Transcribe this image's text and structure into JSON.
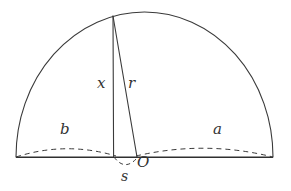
{
  "figure": {
    "kind": "geometry-diagram",
    "background_color": "#ffffff",
    "stroke_color": "#3a3a3a",
    "label_color": "#333333",
    "canvas": {
      "width": 291,
      "height": 191
    }
  },
  "labels": {
    "x": "x",
    "r": "r",
    "a": "a",
    "b": "b",
    "O": "O",
    "s": "s"
  },
  "geometry": {
    "baseline": {
      "x1": 16,
      "y1": 157,
      "x2": 273,
      "y2": 157
    },
    "semicircle": {
      "cx": 144.5,
      "cy": 157,
      "rx": 128.5,
      "ry": 145
    },
    "vertical_segment": {
      "x1": 113,
      "y1": 16,
      "x2": 113,
      "y2": 157
    },
    "radius_segment": {
      "x1": 113,
      "y1": 16,
      "x2": 137,
      "y2": 157
    },
    "dashed_arc_b": {
      "from_x": 16,
      "from_y": 157,
      "to_x": 116,
      "to_y": 157,
      "bulge": 12
    },
    "dashed_arc_a": {
      "from_x": 136,
      "from_y": 157,
      "to_x": 273,
      "to_y": 157,
      "bulge": 13
    },
    "dashed_arc_s": {
      "from_x": 114,
      "from_y": 157,
      "to_x": 137,
      "to_y": 157,
      "dip": 11
    },
    "point_O": {
      "x": 137,
      "y": 157
    },
    "point_foot_x": {
      "x": 113,
      "y": 157
    },
    "point_apex": {
      "x": 113,
      "y": 16
    }
  },
  "style": {
    "stroke_width_solid": 1.1,
    "stroke_width_dashed": 1.0,
    "dash_pattern": "5,4"
  }
}
